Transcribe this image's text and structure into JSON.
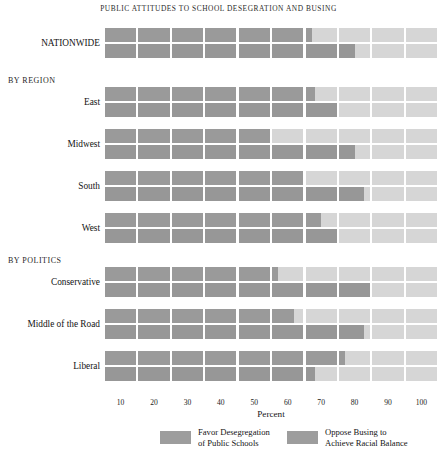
{
  "title": "PUBLIC ATTITUDES TO SCHOOL DESEGRATION AND BUSING",
  "axis": {
    "xlabel": "Percent",
    "ticks": [
      "10",
      "20",
      "30",
      "40",
      "50",
      "60",
      "70",
      "80",
      "90",
      "100"
    ]
  },
  "legend": {
    "items": [
      {
        "label_line1": "Favor Desegregation",
        "label_line2": "of Public Schools",
        "color": "#9d9d9d"
      },
      {
        "label_line1": "Oppose Busing to",
        "label_line2": "Achieve Racial Balance",
        "color": "#9d9d9d"
      }
    ]
  },
  "colors": {
    "favor": "#9a9a9a",
    "oppose": "#979797",
    "remainder": "#d6d6d6",
    "background": "#ffffff"
  },
  "group_headings": [
    {
      "label": "BY REGION"
    },
    {
      "label": "BY POLITICS"
    }
  ],
  "chart_data": {
    "type": "bar",
    "title": "PUBLIC ATTITUDES TO SCHOOL DESEGRATION AND BUSING",
    "xlabel": "Percent",
    "ylabel": "",
    "xlim": [
      0,
      100
    ],
    "grid": false,
    "orientation": "horizontal",
    "segmented_blocks": 10,
    "legend_position": "bottom",
    "series": [
      {
        "name": "Favor Desegregation of Public Schools",
        "color": "#9a9a9a"
      },
      {
        "name": "Oppose Busing to Achieve Racial Balance",
        "color": "#979797"
      }
    ],
    "categories": [
      "NATIONWIDE",
      "East",
      "Midwest",
      "South",
      "West",
      "Conservative",
      "Middle of the Road",
      "Liberal"
    ],
    "values": {
      "favor": [
        62,
        63,
        50,
        60,
        65,
        52,
        57,
        72
      ],
      "oppose": [
        75,
        70,
        75,
        78,
        70,
        80,
        78,
        63
      ]
    },
    "rows": [
      {
        "label": "NATIONWIDE",
        "group": "",
        "favor": 62,
        "oppose": 75
      },
      {
        "label": "East",
        "group": "BY REGION",
        "favor": 63,
        "oppose": 70
      },
      {
        "label": "Midwest",
        "group": "BY REGION",
        "favor": 50,
        "oppose": 75
      },
      {
        "label": "South",
        "group": "BY REGION",
        "favor": 60,
        "oppose": 78
      },
      {
        "label": "West",
        "group": "BY REGION",
        "favor": 65,
        "oppose": 70
      },
      {
        "label": "Conservative",
        "group": "BY POLITICS",
        "favor": 52,
        "oppose": 80
      },
      {
        "label": "Middle of the Road",
        "group": "BY POLITICS",
        "favor": 57,
        "oppose": 78
      },
      {
        "label": "Liberal",
        "group": "BY POLITICS",
        "favor": 72,
        "oppose": 63
      }
    ]
  }
}
